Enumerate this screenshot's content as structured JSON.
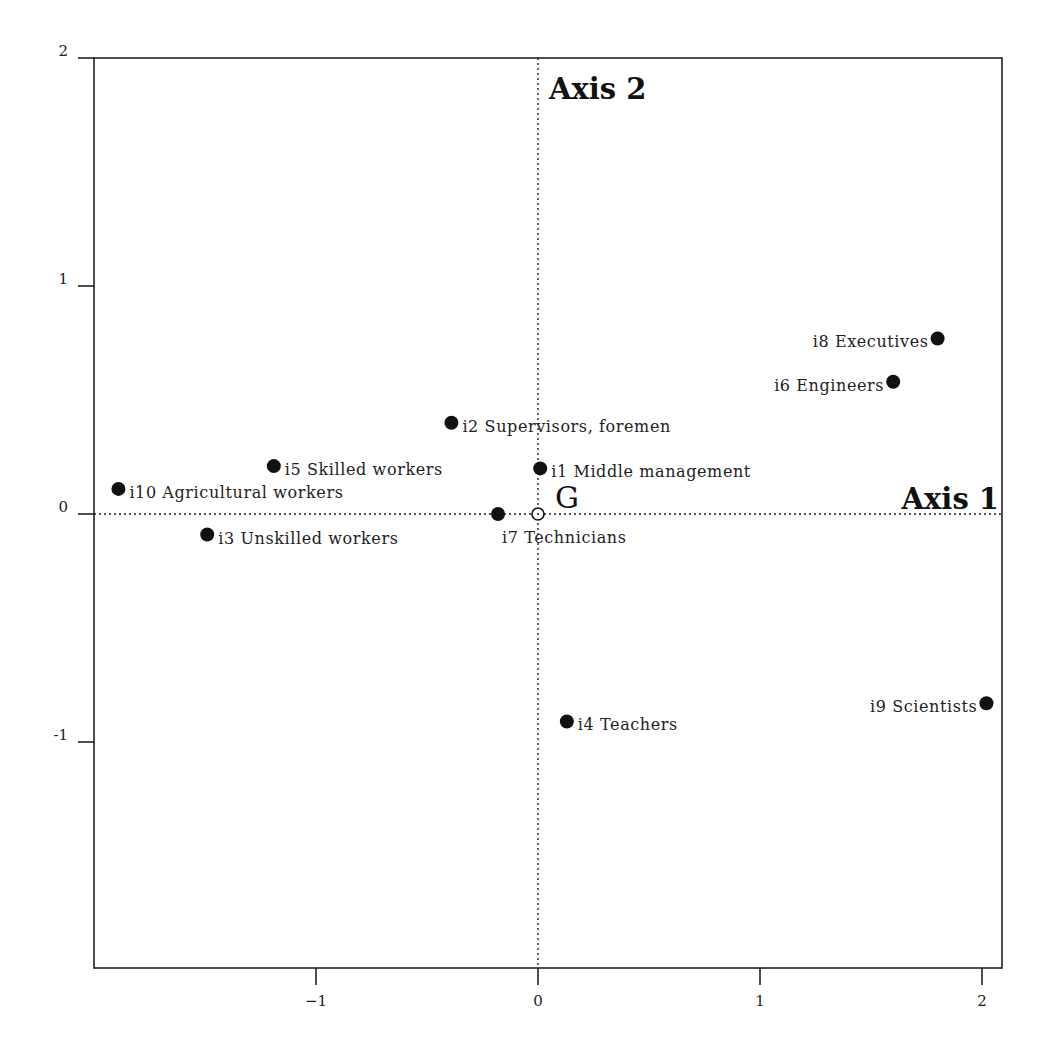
{
  "chart_data": {
    "type": "scatter",
    "title": "",
    "xlabel": "Axis 1",
    "ylabel": "Axis 2",
    "xlim": [
      -2.0,
      2.1
    ],
    "ylim": [
      -2.0,
      2.0
    ],
    "x_ticks": [
      -1,
      0,
      1,
      2
    ],
    "x_tick_labels": [
      "−1",
      "0",
      "1",
      "2"
    ],
    "y_ticks": [
      2,
      1,
      0,
      -1
    ],
    "y_tick_labels": [
      "2",
      "1",
      "0",
      "-1"
    ],
    "grid": false,
    "reference_lines": {
      "x": 0,
      "y": 0,
      "style": "dotted"
    },
    "origin_label": "G",
    "points": [
      {
        "id": "i1",
        "name": "Middle management",
        "label": "i1 Middle management",
        "x": 0.01,
        "y": 0.2,
        "label_pos": "right"
      },
      {
        "id": "i2",
        "name": "Supervisors, foremen",
        "label": "i2 Supervisors, foremen",
        "x": -0.39,
        "y": 0.4,
        "label_pos": "right"
      },
      {
        "id": "i3",
        "name": "Unskilled workers",
        "label": "i3 Unskilled workers",
        "x": -1.49,
        "y": -0.09,
        "label_pos": "right"
      },
      {
        "id": "i4",
        "name": "Teachers",
        "label": "i4 Teachers",
        "x": 0.13,
        "y": -0.91,
        "label_pos": "right"
      },
      {
        "id": "i5",
        "name": "Skilled workers",
        "label": "i5 Skilled workers",
        "x": -1.19,
        "y": 0.21,
        "label_pos": "right"
      },
      {
        "id": "i6",
        "name": "Engineers",
        "label": "i6 Engineers",
        "x": 1.6,
        "y": 0.58,
        "label_pos": "left"
      },
      {
        "id": "i7",
        "name": "Technicians",
        "label": "i7 Technicians",
        "x": -0.18,
        "y": 0.0,
        "label_pos": "below"
      },
      {
        "id": "i8",
        "name": "Executives",
        "label": "i8 Executives",
        "x": 1.8,
        "y": 0.77,
        "label_pos": "left"
      },
      {
        "id": "i9",
        "name": "Scientists",
        "label": "i9 Scientists",
        "x": 2.02,
        "y": -0.83,
        "label_pos": "left"
      },
      {
        "id": "i10",
        "name": "Agricultural workers",
        "label": "i10 Agricultural workers",
        "x": -1.89,
        "y": 0.11,
        "label_pos": "right"
      }
    ]
  },
  "labels": {
    "axis1": "Axis 1",
    "axis2": "Axis 2",
    "origin": "G"
  },
  "colors": {
    "point": "#111111",
    "frame": "#222222",
    "background": "#ffffff"
  }
}
